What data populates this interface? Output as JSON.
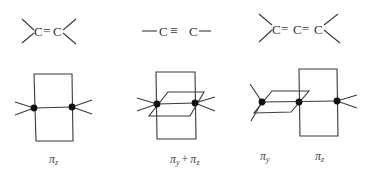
{
  "diagrams": [
    {
      "id": "ethylene",
      "formula": {
        "atoms": [
          "C",
          "C"
        ],
        "bonds": [
          "="
        ],
        "text": ">C=C<"
      },
      "orbital_label": {
        "base": "π",
        "sub": "z"
      }
    },
    {
      "id": "acetylene",
      "formula": {
        "atoms": [
          "C",
          "C"
        ],
        "bonds": [
          "≡"
        ],
        "text": "—C≡C—"
      },
      "orbital_label": {
        "base": "π",
        "sub": "y",
        "plus": "+",
        "base2": "π",
        "sub2": "z"
      }
    },
    {
      "id": "allene",
      "formula": {
        "atoms": [
          "C",
          "C",
          "C"
        ],
        "bonds": [
          "=",
          "="
        ],
        "text": ">C=C=C<"
      },
      "orbital_labels": [
        {
          "base": "π",
          "sub": "y"
        },
        {
          "base": "π",
          "sub": "z"
        }
      ]
    }
  ]
}
